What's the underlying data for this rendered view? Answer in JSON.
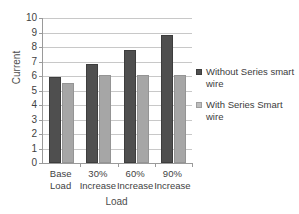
{
  "chart_data": {
    "type": "bar",
    "title": "",
    "xlabel": "Load",
    "ylabel": "Current",
    "ylim": [
      0,
      10
    ],
    "yticks": [
      0,
      1,
      2,
      3,
      4,
      5,
      6,
      7,
      8,
      9,
      10
    ],
    "ytick_labels": [
      "0",
      "1",
      "2",
      "3",
      "4",
      "5",
      "6",
      "7",
      "8",
      "9",
      "10"
    ],
    "grid": true,
    "legend_position": "right",
    "categories": [
      "Base\nLoad",
      "30%\nIncrease",
      "60%\nIncrease",
      "90%\nIncrease"
    ],
    "series": [
      {
        "name": "Without Series smart wire",
        "color": "#4f4f4f",
        "values": [
          5.95,
          6.8,
          7.8,
          8.85
        ]
      },
      {
        "name": "With Series Smart wire",
        "color": "#a6a6a6",
        "values": [
          5.5,
          6.05,
          6.1,
          6.1
        ]
      }
    ]
  },
  "legend": {
    "entries": [
      {
        "label": "Without Series smart wire"
      },
      {
        "label": "With Series Smart wire"
      }
    ]
  },
  "axes": {
    "y_title": "Current",
    "x_title": "Load"
  },
  "colors": {
    "series_dark": "#4f4f4f",
    "series_light": "#a6a6a6",
    "gridline": "#c8c8c8",
    "axis": "#9a9a9a",
    "text": "#3f3f3f",
    "background": "#ffffff"
  }
}
